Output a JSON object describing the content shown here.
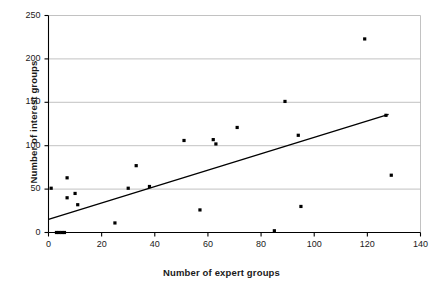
{
  "chart_data": {
    "type": "scatter",
    "title": "",
    "xlabel": "Number of expert groups",
    "ylabel": "Number of interest groups",
    "xlim": [
      0,
      140
    ],
    "ylim": [
      0,
      250
    ],
    "xticks": [
      0,
      20,
      40,
      60,
      80,
      100,
      120,
      140
    ],
    "yticks": [
      0,
      50,
      100,
      150,
      200,
      250
    ],
    "grid": "horizontal",
    "legend": "none",
    "marker_color": "#000000",
    "marker_shape": "square",
    "trendline_color": "#000000",
    "series": [
      {
        "name": "Expert groups vs interest groups",
        "points": [
          [
            1,
            51
          ],
          [
            3,
            0
          ],
          [
            4,
            0
          ],
          [
            5,
            0
          ],
          [
            6,
            0
          ],
          [
            7,
            63
          ],
          [
            7,
            40
          ],
          [
            10,
            45
          ],
          [
            11,
            32
          ],
          [
            25,
            11
          ],
          [
            30,
            51
          ],
          [
            33,
            77
          ],
          [
            38,
            53
          ],
          [
            51,
            106
          ],
          [
            57,
            26
          ],
          [
            62,
            107
          ],
          [
            63,
            102
          ],
          [
            71,
            121
          ],
          [
            85,
            2
          ],
          [
            89,
            151
          ],
          [
            94,
            112
          ],
          [
            95,
            30
          ],
          [
            119,
            223
          ],
          [
            127,
            135
          ],
          [
            129,
            66
          ]
        ]
      }
    ],
    "trendline": {
      "name": "linear fit",
      "x": [
        0,
        128
      ],
      "y": [
        15,
        136
      ]
    }
  },
  "ticks": {
    "y": [
      "250",
      "200",
      "150",
      "100",
      "50",
      "0"
    ],
    "x": [
      "0",
      "20",
      "40",
      "60",
      "80",
      "100",
      "120",
      "140"
    ]
  },
  "labels": {
    "x_title": "Number of expert groups",
    "y_title": "Number of interest groups"
  },
  "colors": {
    "axis": "#000000",
    "grid": "#b3b3b3",
    "marker": "#000000",
    "trendline": "#000000",
    "text": "#1a1a1a",
    "background": "#ffffff"
  }
}
